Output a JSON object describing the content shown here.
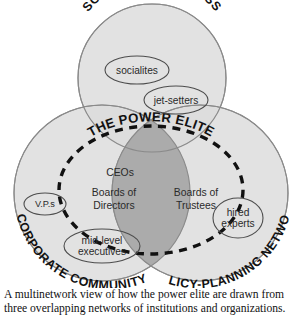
{
  "figure": {
    "type": "venn-diagram",
    "circles": [
      {
        "id": "social-upper-class",
        "label": "SOCIAL UPPER CLASS",
        "position": "top"
      },
      {
        "id": "corporate-community",
        "label": "CORPORATE COMMUNITY",
        "position": "bottom-left"
      },
      {
        "id": "policy-planning-network",
        "label": "POLICY-PLANNING NETWORK",
        "position": "bottom-right"
      }
    ],
    "overlap": {
      "label": "THE POWER ELITE",
      "members": [
        "CEOs",
        "Boards of Directors",
        "Boards of Trustees"
      ]
    },
    "nodes": [
      {
        "id": "socialites",
        "label": "socialites",
        "in": "social-upper-class"
      },
      {
        "id": "jet-setters",
        "label": "jet-setters",
        "in": "social-upper-class"
      },
      {
        "id": "vps",
        "label": "V.P.s",
        "in": "corporate-community"
      },
      {
        "id": "mid-level-executives",
        "line1": "mid-level",
        "line2": "executives",
        "in": "corporate-community"
      },
      {
        "id": "hired-experts",
        "line1": "hired",
        "line2": "experts",
        "in": "policy-planning-network"
      }
    ],
    "center_labels": {
      "ceos": "CEOs",
      "boards_directors_line1": "Boards of",
      "boards_directors_line2": "Directors",
      "boards_trustees_line1": "Boards of",
      "boards_trustees_line2": "Trustees"
    },
    "colors": {
      "circle_fill": "#dcdcdc",
      "overlap_fill": "#a8a8a8",
      "outline": "#8a8a8a",
      "dashed_outline": "#111111",
      "text": "#111111",
      "background": "#ffffff"
    }
  },
  "caption": {
    "line1": "A multinetwork view of how the power elite are drawn from",
    "line2": "three overlapping networks of institutions and organizations."
  }
}
